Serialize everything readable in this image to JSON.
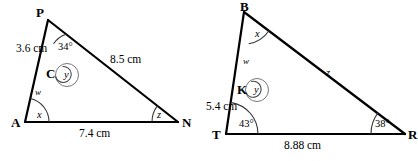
{
  "figure": {
    "stroke_color": "#000000",
    "background_color": "#ffffff",
    "arc_color": "#555555",
    "width": 418,
    "height": 161
  },
  "left_diagram": {
    "name": "triangle-APN",
    "vertices": [
      {
        "label": "P",
        "x": 48,
        "y": 20
      },
      {
        "label": "A",
        "x": 25,
        "y": 122
      },
      {
        "label": "N",
        "x": 178,
        "y": 122
      },
      {
        "label": "C",
        "x": 58,
        "y": 73
      }
    ],
    "vertex_labels": {
      "p": "P",
      "a": "A",
      "n": "N",
      "c": "C"
    },
    "side_labels": {
      "pc": "3.6 cm",
      "pn": "8.5 cm",
      "an": "7.4 cm",
      "ca": "w"
    },
    "angle_labels": {
      "at_p": "34°",
      "at_c": "y",
      "at_a": "x",
      "at_n": "z"
    }
  },
  "right_diagram": {
    "name": "triangle-BTR",
    "vertices": [
      {
        "label": "B",
        "x": 244,
        "y": 12
      },
      {
        "label": "T",
        "x": 226,
        "y": 134
      },
      {
        "label": "R",
        "x": 405,
        "y": 134
      },
      {
        "label": "K",
        "x": 248,
        "y": 89
      }
    ],
    "vertex_labels": {
      "b": "B",
      "t": "T",
      "r": "R",
      "k": "K"
    },
    "side_labels": {
      "kt": "5.4 cm",
      "tr": "8.88 cm",
      "br": "z",
      "bk": "w"
    },
    "angle_labels": {
      "at_b": "x",
      "at_k": "y",
      "at_t": "43°",
      "at_r": "38°"
    }
  }
}
